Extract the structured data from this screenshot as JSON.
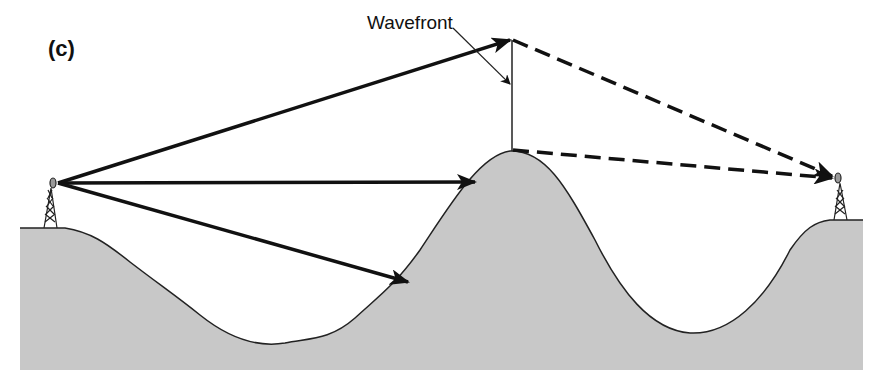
{
  "figure": {
    "panel_label": "(c)",
    "wavefront_label": "Wavefront",
    "colors": {
      "terrain_fill": "#c8c8c8",
      "terrain_outline": "#222222",
      "ray": "#111111",
      "background": "#ffffff"
    },
    "elements": {
      "transmitter": "left tower with antenna dish on left hill",
      "receiver": "right tower with antenna dish on right hill",
      "obstacle": "central mountain peak",
      "direct_rays": [
        "upper ray to wavefront top",
        "horizontal ray hitting peak",
        "lower ray hitting slope"
      ],
      "diffracted_rays": [
        "dashed ray from wavefront top to receiver",
        "dashed ray from peak to receiver"
      ]
    }
  }
}
